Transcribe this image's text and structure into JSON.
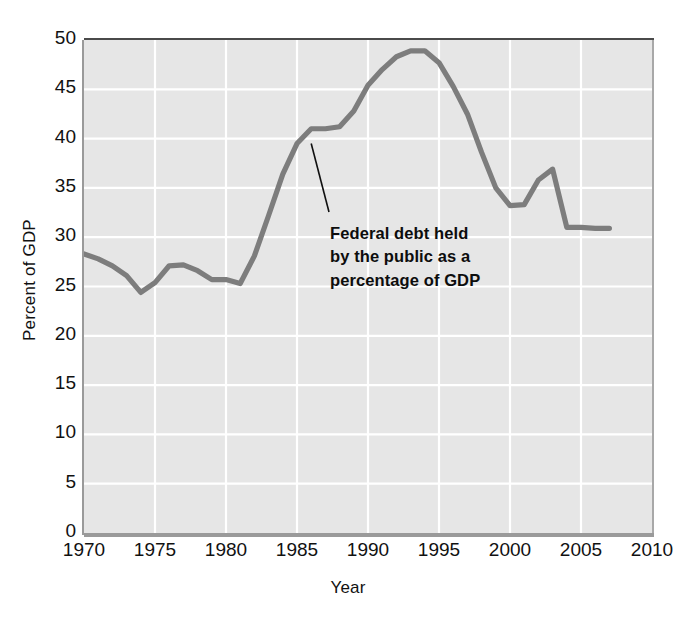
{
  "page": {
    "cut_header_text": " "
  },
  "chart_data": {
    "type": "line",
    "title": "",
    "subtitle": "",
    "xlabel": "Year",
    "ylabel": "Percent of GDP",
    "xlim": [
      1970,
      2010
    ],
    "ylim": [
      0,
      50
    ],
    "grid": true,
    "legend": "none",
    "annotations": [
      {
        "text_lines": [
          "Federal debt held",
          "by the public as a",
          "percentage of GDP"
        ],
        "text": "Federal debt held by the public as a percentage of GDP",
        "points_to_year": 1986,
        "points_to_value": 39.5
      }
    ],
    "xticks": [
      1970,
      1975,
      1980,
      1985,
      1990,
      1995,
      2000,
      2005,
      2010
    ],
    "yticks": [
      0,
      5,
      10,
      15,
      20,
      25,
      30,
      35,
      40,
      45,
      50
    ],
    "colors": {
      "line": "#7d7d7d",
      "plot_background": "#e6e6e6",
      "gridline": "#ffffff",
      "axis": "#9a9a9a",
      "text": "#111111",
      "annotation": "#0d0d0d"
    },
    "series": [
      {
        "name": "Federal debt held by the public as a percentage of GDP",
        "x": [
          1970,
          1971,
          1972,
          1973,
          1974,
          1975,
          1976,
          1977,
          1978,
          1979,
          1980,
          1981,
          1982,
          1983,
          1984,
          1985,
          1986,
          1987,
          1988,
          1989,
          1990,
          1991,
          1992,
          1993,
          1994,
          1995,
          1996,
          1997,
          1998,
          1999,
          2000,
          2001,
          2002,
          2003,
          2004,
          2005,
          2006,
          2007
        ],
        "values": [
          28.3,
          27.8,
          27.1,
          26.1,
          24.4,
          25.4,
          27.1,
          27.2,
          26.6,
          25.7,
          25.7,
          25.3,
          28.1,
          32.2,
          36.4,
          39.5,
          41.0,
          41.0,
          41.2,
          42.8,
          45.4,
          47.0,
          48.3,
          48.9,
          48.9,
          47.7,
          45.3,
          42.5,
          38.6,
          35.0,
          33.2,
          33.3,
          35.8,
          36.9,
          31.0,
          31.0,
          30.9,
          30.9
        ]
      }
    ]
  }
}
